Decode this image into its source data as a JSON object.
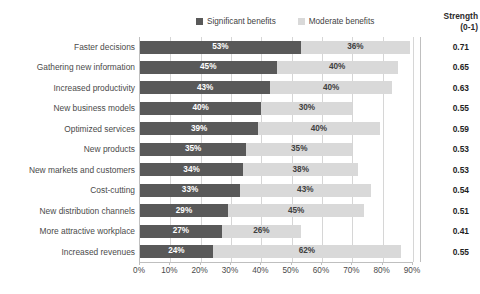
{
  "legend": {
    "entries": [
      {
        "label": "Significant benefits",
        "color": "#595959",
        "icon": "square-swatch"
      },
      {
        "label": "Moderate benefits",
        "color": "#d9d9d9",
        "icon": "square-swatch"
      }
    ]
  },
  "strength_column": {
    "header_line1": "Strength",
    "header_line2": "(0-1)"
  },
  "chart_data": {
    "type": "bar",
    "orientation": "horizontal",
    "stacked": true,
    "title": "",
    "subtitle": "",
    "xlabel": "",
    "ylabel": "",
    "xlim": [
      0,
      90
    ],
    "xtick_labels": [
      "0%",
      "10%",
      "20%",
      "30%",
      "40%",
      "50%",
      "60%",
      "70%",
      "80%",
      "90%"
    ],
    "xtick_values": [
      0,
      10,
      20,
      30,
      40,
      50,
      60,
      70,
      80,
      90
    ],
    "grid": true,
    "legend_position": "top-center",
    "categories": [
      "Faster decisions",
      "Gathering new information",
      "Increased productivity",
      "New business models",
      "Optimized services",
      "New products",
      "New markets and customers",
      "Cost-cutting",
      "New distribution channels",
      "More attractive workplace",
      "Increased revenues"
    ],
    "series": [
      {
        "name": "Significant benefits",
        "color": "#595959",
        "values": [
          53,
          45,
          43,
          40,
          39,
          35,
          34,
          33,
          29,
          27,
          24
        ],
        "labels": [
          "53%",
          "45%",
          "43%",
          "40%",
          "39%",
          "35%",
          "34%",
          "33%",
          "29%",
          "27%",
          "24%"
        ]
      },
      {
        "name": "Moderate benefits",
        "color": "#d9d9d9",
        "values": [
          36,
          40,
          40,
          30,
          40,
          35,
          38,
          43,
          45,
          26,
          62
        ],
        "labels": [
          "36%",
          "40%",
          "40%",
          "30%",
          "40%",
          "35%",
          "38%",
          "43%",
          "45%",
          "26%",
          "62%"
        ]
      }
    ],
    "strength_values": [
      0.71,
      0.65,
      0.63,
      0.55,
      0.59,
      0.53,
      0.53,
      0.54,
      0.51,
      0.41,
      0.55
    ],
    "strength_labels": [
      "0.71",
      "0.65",
      "0.63",
      "0.55",
      "0.59",
      "0.53",
      "0.53",
      "0.54",
      "0.51",
      "0.41",
      "0.55"
    ]
  },
  "colors": {
    "significant": "#595959",
    "moderate": "#d9d9d9",
    "gridline": "#d6d6d6",
    "axis": "#bfbfbf",
    "text": "#4a4a4a",
    "background": "#ffffff"
  }
}
